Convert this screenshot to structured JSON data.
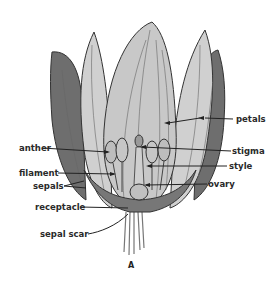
{
  "diagram": {
    "caption": "A",
    "labels": {
      "petals": "petals",
      "anther": "anther",
      "stigma": "stigma",
      "filament": "filament",
      "style": "style",
      "sepals": "sepals",
      "ovary": "ovary",
      "receptacle": "receptacle",
      "sepal_scar": "sepal scar"
    },
    "colors": {
      "sepal_dark": "#6e6e6e",
      "petal_light": "#d2d2d2",
      "petal_mid": "#bdbdbd",
      "outline": "#333333",
      "text": "#2a2a2a"
    }
  }
}
